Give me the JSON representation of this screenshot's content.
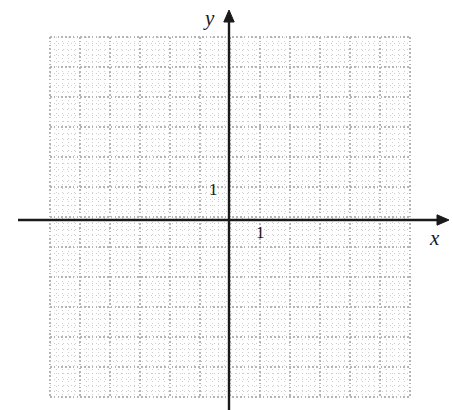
{
  "figure": {
    "kind": "blank-cartesian-grid",
    "background_color": "#ffffff",
    "width": 453,
    "height": 410
  },
  "axes": {
    "x_axis": {
      "label": "x",
      "label_style": "italic-serif",
      "color": "#1a1a1a",
      "arrow": "right",
      "tick_label": "1"
    },
    "y_axis": {
      "label": "y",
      "label_style": "italic-serif",
      "color": "#1a1a1a",
      "arrow": "up",
      "tick_label": "1"
    }
  },
  "chart_data": {
    "type": "scatter",
    "title": "",
    "subtitle": "",
    "xlabel": "x",
    "ylabel": "y",
    "series": [
      {
        "name": "",
        "x": [],
        "y": []
      }
    ],
    "annotations": [],
    "legend": {
      "visible": false,
      "position": "none",
      "entries": []
    },
    "grid": {
      "visible": true,
      "style": "dotted",
      "color": "#c9c9c9",
      "major_color": "#b5b5b5",
      "major_columns": 13,
      "major_rows": 12,
      "major_spacing_px": 30,
      "minor_per_major": 5,
      "left_px": 50,
      "top_px": 37,
      "right_px": 411,
      "bottom_px": 397
    },
    "axis_origin_px": {
      "x": 229,
      "y": 220
    },
    "xlim": [
      -6,
      6.1
    ],
    "ylim": [
      -6,
      6.1
    ],
    "x_ticks": [
      1
    ],
    "x_tick_labels": [
      "1"
    ],
    "y_ticks": [
      1
    ],
    "y_tick_labels": [
      "1"
    ],
    "unit_px": 30,
    "data_labels": []
  }
}
